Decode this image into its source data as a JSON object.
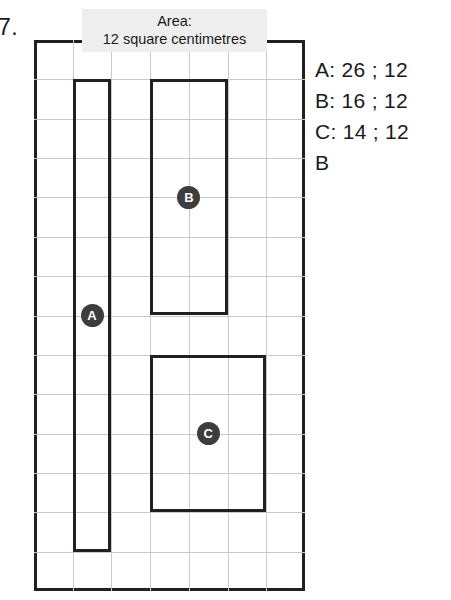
{
  "question": {
    "number": "7."
  },
  "area_label": {
    "line1": "Area:",
    "line2": "12 square centimetres"
  },
  "grid": {
    "columns": 7,
    "rows": 14,
    "cell_px": 38.7,
    "line_color": "#c9c9c9",
    "border_color": "#231f20"
  },
  "shapes": [
    {
      "id": "A",
      "label": "A",
      "col": 1,
      "row": 1,
      "width_cells": 1,
      "height_cells": 12,
      "area": 12,
      "perimeter": 26
    },
    {
      "id": "B",
      "label": "B",
      "col": 3,
      "row": 1,
      "width_cells": 2,
      "height_cells": 6,
      "area": 12,
      "perimeter": 16
    },
    {
      "id": "C",
      "label": "C",
      "col": 3,
      "row": 8,
      "width_cells": 3,
      "height_cells": 4,
      "area": 12,
      "perimeter": 14
    }
  ],
  "answers": {
    "lines": [
      "A: 26 ; 12",
      "B: 16 ; 12",
      "C: 14 ; 12",
      "B"
    ]
  },
  "chart_data": {
    "type": "table",
    "title": "Area: 12 square centimetres",
    "categories": [
      "A",
      "B",
      "C"
    ],
    "series": [
      {
        "name": "Perimeter (cm)",
        "values": [
          26,
          16,
          14
        ]
      },
      {
        "name": "Area (square centimetres)",
        "values": [
          12,
          12,
          12
        ]
      }
    ],
    "annotations": [
      "B"
    ],
    "xlabel": "Shape",
    "ylabel": "",
    "grid": true,
    "legend": "none"
  }
}
